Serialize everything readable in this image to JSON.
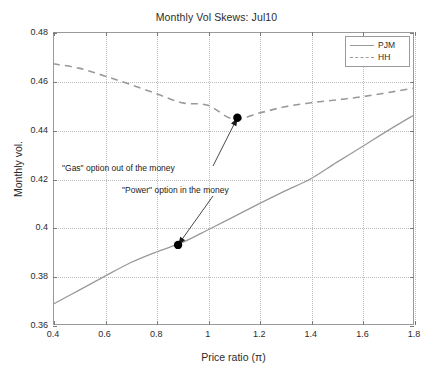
{
  "chart_data": {
    "type": "line",
    "title": "Monthly Vol Skews: Jul10",
    "xlabel": "Price ratio (π)",
    "ylabel": "Monthly vol.",
    "xlim": [
      0.4,
      1.8
    ],
    "ylim": [
      0.36,
      0.48
    ],
    "grid": true,
    "legend_position": "top-right",
    "xticks": [
      "0.4",
      "0.6",
      "0.8",
      "1",
      "1.2",
      "1.4",
      "1.6",
      "1.8"
    ],
    "xtick_values": [
      0.4,
      0.6,
      0.8,
      1.0,
      1.2,
      1.4,
      1.6,
      1.8
    ],
    "yticks": [
      "0.36",
      "0.38",
      "0.4",
      "0.42",
      "0.44",
      "0.46",
      "0.48"
    ],
    "ytick_values": [
      0.36,
      0.38,
      0.4,
      0.42,
      0.44,
      0.46,
      0.48
    ],
    "series": [
      {
        "name": "PJM",
        "style": "solid",
        "color": "#9a9a9a",
        "x": [
          0.4,
          0.5,
          0.6,
          0.7,
          0.8,
          0.9,
          1.0,
          1.1,
          1.2,
          1.3,
          1.4,
          1.5,
          1.6,
          1.7,
          1.8
        ],
        "values": [
          0.3685,
          0.3742,
          0.3799,
          0.3855,
          0.3899,
          0.3937,
          0.3989,
          0.4043,
          0.4097,
          0.4149,
          0.4199,
          0.4266,
          0.4331,
          0.4397,
          0.446
        ]
      },
      {
        "name": "HH",
        "style": "dashed",
        "color": "#9a9a9a",
        "x": [
          0.4,
          0.5,
          0.6,
          0.7,
          0.8,
          0.9,
          1.0,
          1.1,
          1.2,
          1.3,
          1.4,
          1.5,
          1.6,
          1.7,
          1.8
        ],
        "values": [
          0.467,
          0.4652,
          0.462,
          0.4585,
          0.4548,
          0.451,
          0.45,
          0.4443,
          0.4468,
          0.4494,
          0.451,
          0.4522,
          0.4535,
          0.4552,
          0.457
        ]
      }
    ],
    "markers": [
      {
        "name": "gas-marker",
        "x": 1.115,
        "y": 0.4449
      },
      {
        "name": "power-marker",
        "x": 0.885,
        "y": 0.3928
      }
    ],
    "annotations": [
      {
        "name": "gas-annotation",
        "text": "\"Gas\" option out of the money",
        "points_to": {
          "x": 1.115,
          "y": 0.4449
        }
      },
      {
        "name": "power-annotation",
        "text": "\"Power\" option in the money",
        "points_to": {
          "x": 0.885,
          "y": 0.3928
        }
      }
    ]
  },
  "legend": {
    "items": [
      {
        "label": "PJM",
        "style": "solid"
      },
      {
        "label": "HH",
        "style": "dashed"
      }
    ]
  }
}
